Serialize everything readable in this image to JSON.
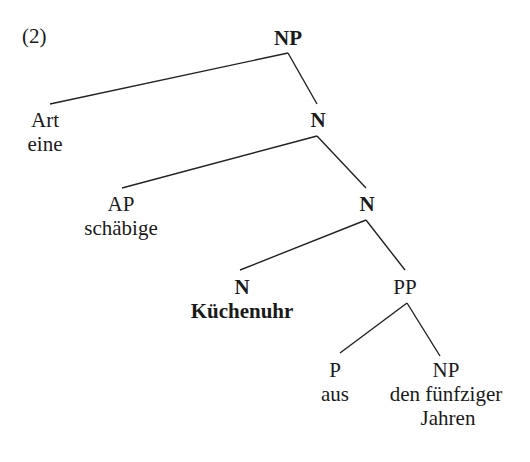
{
  "example_number": "(2)",
  "tree": {
    "root": {
      "label": "NP",
      "bold": true
    },
    "nodes": [
      {
        "id": "art",
        "category": "Art",
        "word": "eine"
      },
      {
        "id": "n1",
        "category": "N",
        "bold": true
      },
      {
        "id": "ap",
        "category": "AP",
        "word": "schäbige"
      },
      {
        "id": "n2",
        "category": "N",
        "bold": true
      },
      {
        "id": "n3",
        "category": "N",
        "word": "Küchenuhr",
        "bold": true
      },
      {
        "id": "pp",
        "category": "PP"
      },
      {
        "id": "p",
        "category": "P",
        "word": "aus"
      },
      {
        "id": "np2",
        "category": "NP",
        "word_line1": "den fünfziger",
        "word_line2": "Jahren"
      }
    ],
    "edges": [
      [
        "NP",
        "Art"
      ],
      [
        "NP",
        "N"
      ],
      [
        "N",
        "AP"
      ],
      [
        "N",
        "N"
      ],
      [
        "N",
        "N"
      ],
      [
        "N",
        "PP"
      ],
      [
        "PP",
        "P"
      ],
      [
        "PP",
        "NP"
      ]
    ]
  }
}
